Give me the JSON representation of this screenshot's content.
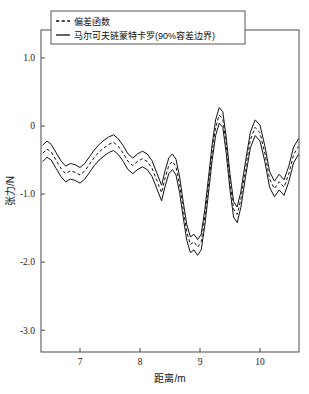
{
  "figure": {
    "background_color": "#ffffff",
    "frame_color": "#4a4a4a",
    "curve_color": "#111111"
  },
  "legend": {
    "position": "top-left",
    "entries": [
      {
        "label": "偏差函数",
        "style": "dashed"
      },
      {
        "label": "马尔可夫链蒙特卡罗(90%容差边界)",
        "style": "solid"
      }
    ]
  },
  "axes": {
    "x": {
      "title": "距离/m",
      "ticks": [
        "7",
        "8",
        "9",
        "10"
      ],
      "tick_values": [
        7,
        8,
        9,
        10
      ],
      "range": [
        6.35,
        10.65
      ]
    },
    "y": {
      "title": "张力/N",
      "ticks": [
        "1.0",
        "0",
        "-1.0",
        "-2.0",
        "-3.0"
      ],
      "tick_values": [
        1.0,
        0,
        -1.0,
        -2.0,
        -3.0
      ],
      "range": [
        -3.32,
        1.41
      ]
    }
  },
  "chart_data": {
    "type": "line",
    "title": "",
    "subtitle": "",
    "xlabel": "距离/m",
    "ylabel": "张力/N",
    "xlim": [
      6.35,
      10.65
    ],
    "ylim": [
      -3.32,
      1.41
    ],
    "grid": false,
    "legend_position": "top-left",
    "annotations": [],
    "x": [
      6.38,
      6.45,
      6.52,
      6.6,
      6.68,
      6.76,
      6.84,
      6.92,
      7.0,
      7.08,
      7.16,
      7.24,
      7.32,
      7.4,
      7.48,
      7.56,
      7.64,
      7.72,
      7.8,
      7.88,
      7.96,
      8.04,
      8.12,
      8.2,
      8.28,
      8.36,
      8.42,
      8.48,
      8.54,
      8.6,
      8.66,
      8.72,
      8.78,
      8.84,
      8.9,
      8.96,
      9.02,
      9.08,
      9.14,
      9.2,
      9.26,
      9.32,
      9.38,
      9.44,
      9.5,
      9.56,
      9.62,
      9.68,
      9.76,
      9.84,
      9.92,
      10.0,
      10.08,
      10.16,
      10.24,
      10.32,
      10.4,
      10.48,
      10.56,
      10.64
    ],
    "series": [
      {
        "name": "偏差函数",
        "style": "dashed",
        "values": [
          -0.4,
          -0.34,
          -0.38,
          -0.5,
          -0.62,
          -0.7,
          -0.66,
          -0.68,
          -0.72,
          -0.66,
          -0.56,
          -0.46,
          -0.38,
          -0.32,
          -0.27,
          -0.24,
          -0.3,
          -0.4,
          -0.52,
          -0.58,
          -0.52,
          -0.48,
          -0.52,
          -0.62,
          -0.8,
          -0.98,
          -0.76,
          -0.58,
          -0.52,
          -0.6,
          -0.86,
          -1.22,
          -1.56,
          -1.74,
          -1.7,
          -1.78,
          -1.7,
          -1.34,
          -0.88,
          -0.4,
          -0.02,
          0.16,
          0.1,
          -0.3,
          -0.82,
          -1.22,
          -1.3,
          -1.08,
          -0.62,
          -0.2,
          -0.02,
          -0.1,
          -0.4,
          -0.78,
          -0.92,
          -0.82,
          -0.9,
          -0.7,
          -0.42,
          -0.3
        ]
      },
      {
        "name": "90%容差上边界",
        "style": "solid",
        "values": [
          -0.28,
          -0.22,
          -0.27,
          -0.39,
          -0.51,
          -0.59,
          -0.55,
          -0.57,
          -0.61,
          -0.55,
          -0.45,
          -0.35,
          -0.27,
          -0.21,
          -0.16,
          -0.13,
          -0.19,
          -0.29,
          -0.41,
          -0.47,
          -0.41,
          -0.37,
          -0.41,
          -0.51,
          -0.69,
          -0.87,
          -0.65,
          -0.47,
          -0.41,
          -0.49,
          -0.75,
          -1.11,
          -1.45,
          -1.63,
          -1.59,
          -1.67,
          -1.59,
          -1.23,
          -0.77,
          -0.29,
          0.09,
          0.27,
          0.21,
          -0.19,
          -0.71,
          -1.11,
          -1.19,
          -0.97,
          -0.51,
          -0.09,
          0.09,
          0.01,
          -0.29,
          -0.67,
          -0.81,
          -0.71,
          -0.79,
          -0.59,
          -0.31,
          -0.19
        ]
      },
      {
        "name": "90%容差下边界",
        "style": "solid",
        "values": [
          -0.52,
          -0.46,
          -0.5,
          -0.62,
          -0.74,
          -0.82,
          -0.78,
          -0.8,
          -0.84,
          -0.78,
          -0.68,
          -0.58,
          -0.5,
          -0.44,
          -0.39,
          -0.36,
          -0.42,
          -0.52,
          -0.64,
          -0.7,
          -0.64,
          -0.6,
          -0.64,
          -0.74,
          -0.92,
          -1.1,
          -0.88,
          -0.7,
          -0.64,
          -0.72,
          -0.98,
          -1.34,
          -1.68,
          -1.86,
          -1.82,
          -1.9,
          -1.82,
          -1.46,
          -1.0,
          -0.52,
          -0.14,
          0.04,
          -0.02,
          -0.42,
          -0.94,
          -1.34,
          -1.42,
          -1.2,
          -0.74,
          -0.32,
          -0.14,
          -0.22,
          -0.52,
          -0.9,
          -1.04,
          -0.94,
          -1.02,
          -0.82,
          -0.54,
          -0.42
        ]
      }
    ]
  }
}
